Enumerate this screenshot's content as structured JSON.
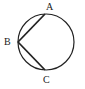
{
  "diagram": {
    "type": "circle-with-inscribed-chords",
    "circle": {
      "cx": 46,
      "cy": 42,
      "r": 28
    },
    "points": [
      {
        "label": "A",
        "x": 45,
        "y": 14,
        "label_x": 46,
        "label_y": 10
      },
      {
        "label": "B",
        "x": 18,
        "y": 42,
        "label_x": 5,
        "label_y": 45
      },
      {
        "label": "C",
        "x": 45,
        "y": 70,
        "label_x": 44,
        "label_y": 83
      }
    ],
    "chords": [
      {
        "from": "A",
        "to": "B"
      },
      {
        "from": "B",
        "to": "C"
      }
    ],
    "colors": {
      "stroke": "#222222",
      "background": "#ffffff"
    }
  }
}
